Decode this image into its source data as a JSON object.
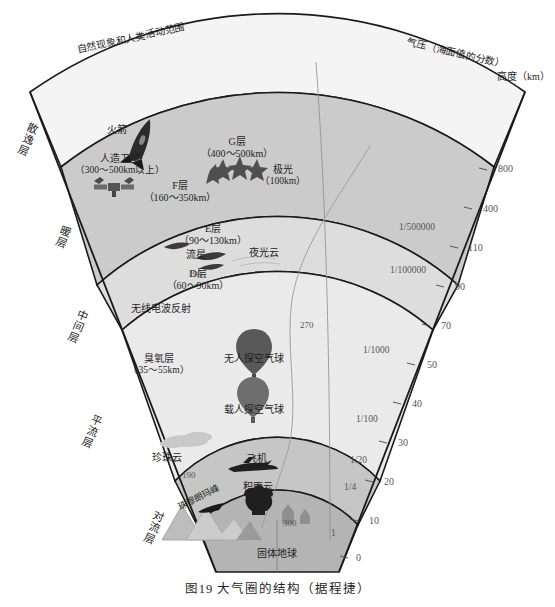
{
  "figure": {
    "caption": "图19  大气圈的结构（据程捷）",
    "top_left_note": "自然现象和人类活动范围",
    "pressure_axis_title": "气压（海面值的分数）",
    "height_axis_title": "高度（km）"
  },
  "sphere_labels": [
    {
      "name": "exosphere",
      "text": "散逸层"
    },
    {
      "name": "thermosphere",
      "text": "暖层"
    },
    {
      "name": "mesosphere",
      "text": "中间层"
    },
    {
      "name": "stratosphere",
      "text": "平流层"
    },
    {
      "name": "troposphere",
      "text": "对流层"
    }
  ],
  "ionosphere_layers": [
    {
      "name": "g-layer",
      "label": "G层",
      "range": "（400～500km）"
    },
    {
      "name": "f-layer",
      "label": "F层",
      "range": "（160～350km）"
    },
    {
      "name": "e-layer",
      "label": "E层",
      "range": "（90～130km）"
    },
    {
      "name": "d-layer",
      "label": "D层",
      "range": "（60～90km）"
    }
  ],
  "features": [
    {
      "name": "rocket",
      "text": "火箭"
    },
    {
      "name": "satellite",
      "text": "人造卫星",
      "range": "（300～500km以上）"
    },
    {
      "name": "aurora",
      "text": "极光",
      "range": "（100km）"
    },
    {
      "name": "meteor",
      "text": "流星"
    },
    {
      "name": "noctilucent-cloud",
      "text": "夜光云"
    },
    {
      "name": "radio-reflection",
      "text": "无线电波反射"
    },
    {
      "name": "ozone-layer",
      "text": "臭氧层",
      "range": "（35～55km）"
    },
    {
      "name": "unmanned-balloon",
      "text": "无人探空气球"
    },
    {
      "name": "manned-balloon",
      "text": "载人探空气球"
    },
    {
      "name": "nacreous-cloud",
      "text": "珍珠云"
    },
    {
      "name": "airplane",
      "text": "飞机"
    },
    {
      "name": "cumulonimbus",
      "text": "积雨云"
    },
    {
      "name": "mount-everest",
      "text": "珠穆朗玛峰"
    },
    {
      "name": "solid-earth",
      "text": "固体地球"
    }
  ],
  "temperature_marks": [
    {
      "name": "temp-190-upper",
      "text": "190"
    },
    {
      "name": "temp-270",
      "text": "270"
    },
    {
      "name": "temp-190-lower",
      "text": "190"
    },
    {
      "name": "temp-300",
      "text": "300"
    }
  ],
  "pressure_ticks": [
    {
      "name": "pressure-1-500000",
      "text": "1/500000"
    },
    {
      "name": "pressure-1-100000",
      "text": "1/100000"
    },
    {
      "name": "pressure-1-1000",
      "text": "1/1000"
    },
    {
      "name": "pressure-1-100",
      "text": "1/100"
    },
    {
      "name": "pressure-1-20",
      "text": "1/20"
    },
    {
      "name": "pressure-1-4",
      "text": "1/4"
    },
    {
      "name": "pressure-1",
      "text": "1"
    }
  ],
  "height_ticks": [
    {
      "name": "height-800",
      "text": "800"
    },
    {
      "name": "height-400",
      "text": "400"
    },
    {
      "name": "height-110",
      "text": "110"
    },
    {
      "name": "height-90",
      "text": "90"
    },
    {
      "name": "height-70",
      "text": "70"
    },
    {
      "name": "height-50",
      "text": "50"
    },
    {
      "name": "height-40",
      "text": "40"
    },
    {
      "name": "height-30",
      "text": "30"
    },
    {
      "name": "height-20",
      "text": "20"
    },
    {
      "name": "height-10",
      "text": "10"
    },
    {
      "name": "height-0",
      "text": "0"
    }
  ],
  "colors": {
    "outline": "#1a1a1a",
    "band_exosphere": "#f2f2f2",
    "band_thermosphere": "#c9c9c9",
    "band_mesosphere": "#dcdcdc",
    "band_stratosphere": "#e9e9e9",
    "band_troposphere": "#c5c5c5",
    "band_earth": "#b3b3b3",
    "thin_line": "#8a8a8a",
    "text": "#1f1f1f",
    "tick_text": "#6e6e6e"
  }
}
